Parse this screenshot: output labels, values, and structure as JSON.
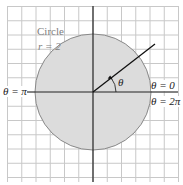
{
  "diagram": {
    "type": "polar-graph",
    "grid": {
      "left": 7,
      "top": 6,
      "right": 178,
      "bottom": 182,
      "spacing": 14.25,
      "color": "#c8c8c8"
    },
    "axes": {
      "origin_x": 93,
      "origin_y": 92,
      "color": "#222222"
    },
    "circle": {
      "cx": 93,
      "cy": 92,
      "r": 58,
      "fill": "#dcdcdc",
      "stroke": "#888888"
    },
    "ray": {
      "x2": 155,
      "y2": 44
    },
    "labels": {
      "circle_title": "Circle",
      "circle_radius": "r = 2",
      "theta": "θ",
      "theta_pi": "θ = π",
      "theta_zero": "θ = 0",
      "theta_2pi": "θ = 2π"
    }
  }
}
